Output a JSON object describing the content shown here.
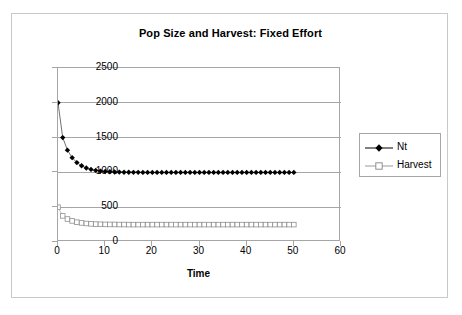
{
  "chart_data": {
    "type": "line",
    "title": "Pop Size and Harvest: Fixed Effort",
    "xlabel": "Time",
    "ylabel": "",
    "xlim": [
      0,
      60
    ],
    "ylim": [
      0,
      2500
    ],
    "xticks": [
      "0",
      "10",
      "20",
      "30",
      "40",
      "50",
      "60"
    ],
    "yticks": [
      "0",
      "500",
      "1000",
      "1500",
      "2000",
      "2500"
    ],
    "grid": "horizontal",
    "legend_position": "right",
    "x": [
      0,
      1,
      2,
      3,
      4,
      5,
      6,
      7,
      8,
      9,
      10,
      11,
      12,
      13,
      14,
      15,
      16,
      17,
      18,
      19,
      20,
      21,
      22,
      23,
      24,
      25,
      26,
      27,
      28,
      29,
      30,
      31,
      32,
      33,
      34,
      35,
      36,
      37,
      38,
      39,
      40,
      41,
      42,
      43,
      44,
      45,
      46,
      47,
      48,
      49,
      50
    ],
    "series": [
      {
        "name": "Nt",
        "marker": "filled-diamond",
        "color": "#000000",
        "values": [
          2000,
          1500,
          1320,
          1212,
          1141,
          1095,
          1064,
          1043,
          1029,
          1019,
          1013,
          1009,
          1006,
          1004,
          1003,
          1002,
          1001,
          1001,
          1000,
          1000,
          1000,
          1000,
          1000,
          1000,
          1000,
          1000,
          1000,
          1000,
          1000,
          1000,
          1000,
          1000,
          1000,
          1000,
          1000,
          1000,
          1000,
          1000,
          1000,
          1000,
          1000,
          1000,
          1000,
          1000,
          1000,
          1000,
          1000,
          1000,
          1000,
          1000,
          1000
        ]
      },
      {
        "name": "Harvest",
        "marker": "open-square",
        "color": "#9a9a9a",
        "values": [
          500,
          375,
          330,
          303,
          285,
          274,
          266,
          261,
          257,
          255,
          253,
          252,
          252,
          251,
          251,
          250,
          250,
          250,
          250,
          250,
          250,
          250,
          250,
          250,
          250,
          250,
          250,
          250,
          250,
          250,
          250,
          250,
          250,
          250,
          250,
          250,
          250,
          250,
          250,
          250,
          250,
          250,
          250,
          250,
          250,
          250,
          250,
          250,
          250,
          250,
          250
        ]
      }
    ]
  },
  "legend": {
    "items": [
      {
        "label": "Nt"
      },
      {
        "label": "Harvest"
      }
    ]
  }
}
